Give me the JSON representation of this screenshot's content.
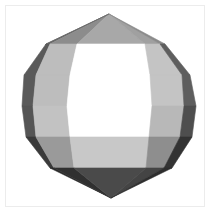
{
  "figure": {
    "background": "#ffffff",
    "frame_color": "#ececec",
    "vertices": {
      "top_apex": [
        109,
        14
      ],
      "bottom_apex": [
        111,
        198
      ],
      "rows": [
        {
          "y": 44,
          "x": [
            46,
            50,
            77,
            145,
            160,
            165
          ]
        },
        {
          "y": 75,
          "x": [
            24,
            36,
            70,
            150,
            182,
            190
          ]
        },
        {
          "y": 106,
          "x": [
            22,
            33,
            67,
            152,
            184,
            196
          ]
        },
        {
          "y": 137,
          "x": [
            26,
            36,
            70,
            149,
            180,
            192
          ]
        },
        {
          "y": 168,
          "x": [
            50,
            54,
            74,
            146,
            164,
            172
          ]
        }
      ]
    },
    "shades": {
      "top_cap": [
        "#6a6a6a",
        "#8c8c8c",
        "#a8a8a8",
        "#a0a0a0",
        "#8a8a8a",
        "#666666"
      ],
      "band1": [
        "#5a5a5a",
        "#bdbdbd",
        "#ffffff",
        "#c4c4c4",
        "#5e5e5e"
      ],
      "band2": [
        "#555555",
        "#c2c2c2",
        "#ffffff",
        "#b8b8b8",
        "#4e4e4e"
      ],
      "band3": [
        "#3a3a3a",
        "#9a9a9a",
        "#c8c8c8",
        "#8e8e8e",
        "#333333"
      ],
      "bottom_cap": [
        "#2a2a2a",
        "#303030",
        "#4a4a4a",
        "#444444",
        "#2e2e2e",
        "#262626"
      ]
    }
  }
}
